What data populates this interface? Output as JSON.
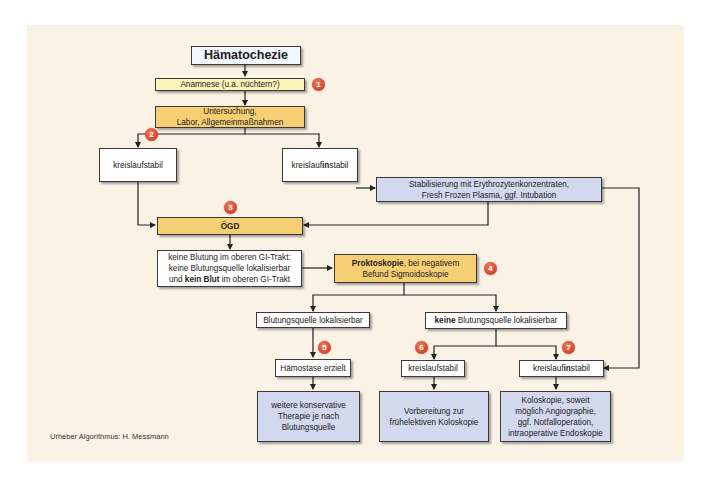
{
  "diagram": {
    "title": "Hämatochezie",
    "nodes": {
      "anamnese": "Anamnese (u.a. nüchtern?)",
      "untersuchung_1": "Untersuchung,",
      "untersuchung_2": "Labor, Allgemeinmaßnahmen",
      "stabil_top": "kreislaufstabil",
      "instabil_top_pre": "kreislauf",
      "instabil_top_bold": "in",
      "instabil_top_post": "stabil",
      "stabilisierung_1": "Stabilisierung mit Erythrozytenkonzentraten,",
      "stabilisierung_2": "Fresh Frozen Plasma, ggf. Intubation",
      "oegd": "ÖGD",
      "keine_blutung_1": "keine Blutung im oberen GI-Trakt:",
      "keine_blutung_2": "keine Blutungsquelle lokalisierbar",
      "keine_blutung_3_pre": "und ",
      "keine_blutung_3_bold": "kein Blut",
      "keine_blutung_3_post": " im oberen GI-Trakt",
      "prokto_bold": "Proktoskopie",
      "prokto_rest_1": ", bei negativem",
      "prokto_rest_2": "Befund Sigmoidoskopie",
      "quelle_lokal": "Blutungsquelle lokalisierbar",
      "keine_quelle_bold": "keine",
      "keine_quelle_rest": " Blutungsquelle lokalisierbar",
      "haemostase": "Hämostase erzielt",
      "stabil_bottom": "kreislaufstabil",
      "instabil_bottom_pre": "kreislauf",
      "instabil_bottom_bold": "in",
      "instabil_bottom_post": "stabil",
      "weitere_1": "weitere konservative",
      "weitere_2": "Therapie je nach",
      "weitere_3": "Blutungsquelle",
      "vorbereitung_1": "Vorbereitung zur",
      "vorbereitung_2": "frühelektiven Koloskopie",
      "kolo_1": "Koloskopie, soweit",
      "kolo_2": "möglich Angiographie,",
      "kolo_3": "ggf. Notfalloperation,",
      "kolo_4": "intraoperative Endoskopie"
    },
    "badges": [
      "1",
      "2",
      "3",
      "4",
      "5",
      "6",
      "7"
    ],
    "credit": "Urheber Algorithmus: H. Messmann"
  },
  "colors": {
    "panel": "#fbf2e6",
    "yellow_light": "#fbf3b8",
    "orange": "#f6ce74",
    "blue": "#d2d8ee",
    "badge": "#d2432a"
  }
}
